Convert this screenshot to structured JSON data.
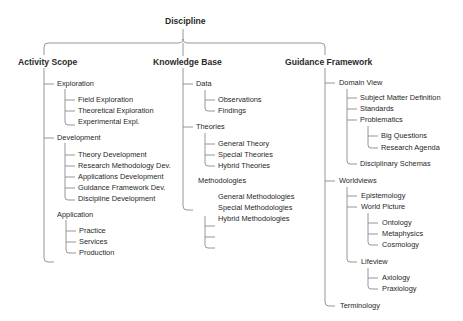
{
  "diagram": {
    "root": "Discipline",
    "branches": [
      {
        "label": "Activity Scope",
        "children": [
          {
            "label": "Exploration",
            "children": [
              "Field Exploration",
              "Theoretical Exploration",
              "Experimental Expl."
            ]
          },
          {
            "label": "Development",
            "children": [
              "Theory Development",
              "Research Methodology Dev.",
              "Applications Development",
              "Guidance Framework Dev.",
              "Discipline Development"
            ]
          },
          {
            "label": "Application",
            "children": [
              "Practice",
              "Services",
              "Production"
            ]
          }
        ]
      },
      {
        "label": "Knowledge Base",
        "children": [
          {
            "label": "Data",
            "children": [
              "Observations",
              "Findings"
            ]
          },
          {
            "label": "Theories",
            "children": [
              "General Theory",
              "Special Theories",
              "Hybrid Theories"
            ]
          },
          {
            "label": "Methodologies",
            "children": [
              "General Methodologies",
              "Special Methodologies",
              "Hybrid Methodologies"
            ]
          }
        ]
      },
      {
        "label": "Guidance Framework",
        "children": [
          {
            "label": "Domain View",
            "children": [
              "Subject Matter Definition",
              "Standards",
              {
                "label": "Problematics",
                "children": [
                  "Big Questions",
                  "Research Agenda"
                ]
              },
              "Disciplinary Schemas"
            ]
          },
          {
            "label": "Worldviews",
            "children": [
              "Epistemology",
              {
                "label": "World Picture",
                "children": [
                  "Ontology",
                  "Metaphysics",
                  "Cosmology"
                ]
              },
              {
                "label": "Lifeview",
                "children": [
                  "Axiology",
                  "Praxiology"
                ]
              }
            ]
          },
          {
            "label": "Terminology",
            "children": []
          }
        ]
      }
    ]
  },
  "labels": {
    "root": "Discipline",
    "as": "Activity Scope",
    "as_expl": "Exploration",
    "as_expl_1": "Field Exploration",
    "as_expl_2": "Theoretical Exploration",
    "as_expl_3": "Experimental Expl.",
    "as_dev": "Development",
    "as_dev_1": "Theory Development",
    "as_dev_2": "Research Methodology Dev.",
    "as_dev_3": "Applications Development",
    "as_dev_4": "Guidance Framework Dev.",
    "as_dev_5": "Discipline Development",
    "as_app": "Application",
    "as_app_1": "Practice",
    "as_app_2": "Services",
    "as_app_3": "Production",
    "kb": "Knowledge Base",
    "kb_data": "Data",
    "kb_data_1": "Observations",
    "kb_data_2": "Findings",
    "kb_th": "Theories",
    "kb_th_1": "General Theory",
    "kb_th_2": "Special Theories",
    "kb_th_3": "Hybrid Theories",
    "kb_meth": "Methodologies",
    "kb_meth_1": "General Methodologies",
    "kb_meth_2": "Special Methodologies",
    "kb_meth_3": "Hybrid Methodologies",
    "gf": "Guidance Framework",
    "gf_dv": "Domain View",
    "gf_dv_1": "Subject Matter Definition",
    "gf_dv_2": "Standards",
    "gf_dv_3": "Problematics",
    "gf_dv_3_1": "Big Questions",
    "gf_dv_3_2": "Research Agenda",
    "gf_dv_4": "Disciplinary Schemas",
    "gf_wv": "Worldviews",
    "gf_wv_1": "Epistemology",
    "gf_wv_2": "World Picture",
    "gf_wv_2_1": "Ontology",
    "gf_wv_2_2": "Metaphysics",
    "gf_wv_2_3": "Cosmology",
    "gf_wv_3": "Lifeview",
    "gf_wv_3_1": "Axiology",
    "gf_wv_3_2": "Praxiology",
    "gf_term": "Terminology"
  },
  "colors": {
    "line": "#8a8a8a",
    "text": "#1f1f1f",
    "background": "#ffffff"
  }
}
